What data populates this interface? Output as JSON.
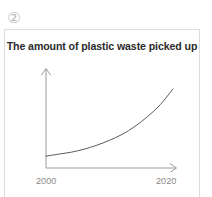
{
  "item_number": "②",
  "panel": {
    "border_color": "#dcdcdc",
    "background": "#ffffff"
  },
  "chart_data": {
    "type": "line",
    "title": "The amount of plastic waste picked up",
    "xlabel": "",
    "ylabel": "",
    "grid": false,
    "legend": "none",
    "axis_style": "arrow-headed open axes (no tick marks, no numeric y scale)",
    "axis_color": "#9a9a9a",
    "line_color": "#5a5a5a",
    "x_tick_labels": [
      "2000",
      "2020"
    ],
    "xlim": [
      2000,
      2020
    ],
    "ylim": [
      0,
      1
    ],
    "annotations": [],
    "series": [
      {
        "name": "Amount of plastic waste picked up",
        "x": [
          2000,
          2002,
          2004,
          2006,
          2008,
          2010,
          2012,
          2014,
          2016,
          2018,
          2020
        ],
        "values": [
          0.12,
          0.14,
          0.16,
          0.19,
          0.23,
          0.28,
          0.34,
          0.42,
          0.52,
          0.64,
          0.8
        ]
      }
    ]
  }
}
